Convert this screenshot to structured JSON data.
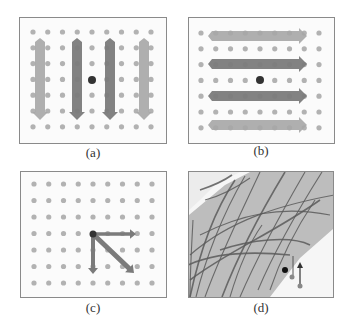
{
  "figure": {
    "panels": [
      {
        "id": "a",
        "label": "(a)",
        "description": "vertical downward arrow field on dot grid"
      },
      {
        "id": "b",
        "label": "(b)",
        "description": "horizontal rightward arrow field on dot grid"
      },
      {
        "id": "c",
        "label": "(c)",
        "description": "three arrows from a grid point: right, down, diagonal"
      },
      {
        "id": "d",
        "label": "(d)",
        "description": "image of branching strands with diagonal gray band and small vector"
      }
    ],
    "colors": {
      "grid_dot": "#b2b2b2",
      "center_dot": "#333333",
      "arrow_dark": "#7b7b7b",
      "arrow_light": "#a6a6a6",
      "frame": "#8a8a8a",
      "band": "#bdbdbd",
      "strand": "#5a5a5a"
    },
    "grid": {
      "cols": 9,
      "rows": 7
    }
  }
}
